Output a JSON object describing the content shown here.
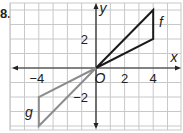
{
  "problem_number": "8.",
  "chart_data": {
    "type": "line",
    "title": "",
    "xlabel": "x",
    "ylabel": "y",
    "origin_label": "O",
    "xlim": [
      -6,
      6
    ],
    "ylim": [
      -4,
      4
    ],
    "grid": true,
    "x_ticks": [
      {
        "value": -4,
        "label": "−4"
      },
      {
        "value": 2,
        "label": "2"
      },
      {
        "value": 4,
        "label": "4"
      }
    ],
    "y_ticks": [
      {
        "value": 2,
        "label": "2"
      },
      {
        "value": -2,
        "label": "−2"
      }
    ],
    "series": [
      {
        "name": "f",
        "color": "#1a1a1a",
        "closed": true,
        "points": [
          [
            0,
            0
          ],
          [
            4,
            4
          ],
          [
            4,
            2
          ]
        ]
      },
      {
        "name": "g",
        "color": "#8c8c8c",
        "closed": true,
        "points": [
          [
            0,
            0
          ],
          [
            -4,
            -2
          ],
          [
            -4,
            -4
          ]
        ]
      }
    ],
    "colors": {
      "grid": "#c8c8c8",
      "axis": "#222222"
    }
  }
}
